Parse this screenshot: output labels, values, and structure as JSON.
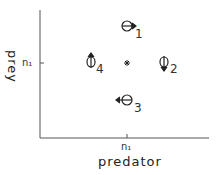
{
  "diagram": {
    "type": "phase-plane",
    "x_axis": {
      "label": "predator",
      "tick_label": "n₁"
    },
    "y_axis": {
      "label": "prey",
      "tick_label": "n₁"
    },
    "equilibrium_marker": "*",
    "points": [
      {
        "id": "1",
        "label": "1",
        "arrow": "right"
      },
      {
        "id": "2",
        "label": "2",
        "arrow": "down"
      },
      {
        "id": "3",
        "label": "3",
        "arrow": "left"
      },
      {
        "id": "4",
        "label": "4",
        "arrow": "up"
      }
    ]
  }
}
